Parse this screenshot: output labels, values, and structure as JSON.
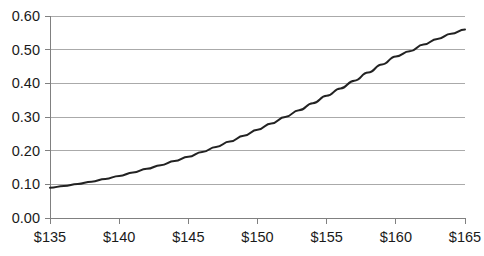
{
  "chart_data": {
    "type": "line",
    "title": "",
    "subtitle": "",
    "xlabel": "",
    "ylabel": "",
    "xlim": [
      135,
      165
    ],
    "ylim": [
      0.0,
      0.6
    ],
    "grid": true,
    "legend": false,
    "legend_position": "none",
    "x_tick_labels": [
      "$135",
      "$140",
      "$145",
      "$150",
      "$155",
      "$160",
      "$165"
    ],
    "x_ticks": [
      135,
      140,
      145,
      150,
      155,
      160,
      165
    ],
    "y_tick_labels": [
      "0.00",
      "0.10",
      "0.20",
      "0.30",
      "0.40",
      "0.50",
      "0.60"
    ],
    "y_ticks": [
      0.0,
      0.1,
      0.2,
      0.3,
      0.4,
      0.5,
      0.6
    ],
    "series": [
      {
        "name": "curve",
        "color": "#222222",
        "x": [
          135,
          136,
          137,
          138,
          139,
          140,
          141,
          142,
          143,
          144,
          145,
          146,
          147,
          148,
          149,
          150,
          151,
          152,
          153,
          154,
          155,
          156,
          157,
          158,
          159,
          160,
          161,
          162,
          163,
          164,
          165
        ],
        "values": [
          0.09,
          0.095,
          0.101,
          0.108,
          0.116,
          0.125,
          0.135,
          0.146,
          0.157,
          0.169,
          0.182,
          0.196,
          0.211,
          0.227,
          0.244,
          0.262,
          0.281,
          0.3,
          0.32,
          0.341,
          0.363,
          0.385,
          0.408,
          0.432,
          0.456,
          0.48,
          0.495,
          0.515,
          0.532,
          0.547,
          0.56
        ]
      }
    ]
  },
  "style": {
    "grid_color": "#aaaaaa",
    "axis_color": "#808080",
    "line_color": "#222222",
    "tick_text_color": "#1a1a1a",
    "background": "#ffffff"
  },
  "geometry": {
    "plot_left": 50,
    "plot_right": 465,
    "plot_top": 16,
    "plot_bottom": 218
  }
}
